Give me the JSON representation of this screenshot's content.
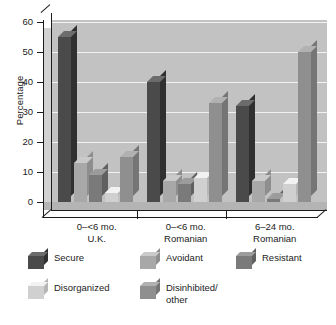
{
  "chart_data": {
    "type": "bar",
    "title": "",
    "xlabel": "",
    "ylabel": "Percentage",
    "ylim": [
      0,
      60
    ],
    "yticks": [
      0,
      10,
      20,
      30,
      40,
      50,
      60
    ],
    "grid": true,
    "legend_position": "below",
    "categories": [
      "0–<6 mo.\nU.K.",
      "0–<6 mo.\nRomanian",
      "6–24 mo.\nRomanian"
    ],
    "category_lines": [
      [
        "0–<6 mo.",
        "U.K."
      ],
      [
        "0–<6 mo.",
        "Romanian"
      ],
      [
        "6–24 mo.",
        "Romanian"
      ]
    ],
    "series": [
      {
        "name": "Secure",
        "color": "#4a4a4a",
        "values": [
          55,
          40,
          32
        ]
      },
      {
        "name": "Avoidant",
        "color": "#a8a8a8",
        "values": [
          13,
          7,
          7
        ]
      },
      {
        "name": "Resistant",
        "color": "#7a7a7a",
        "values": [
          9,
          6,
          1
        ]
      },
      {
        "name": "Disorganized",
        "color": "#d0d0d0",
        "values": [
          3,
          8,
          6
        ]
      },
      {
        "name": "Disinhibited/\nother",
        "color": "#8f8f8f",
        "values": [
          15,
          33,
          50
        ]
      }
    ]
  },
  "axis": {
    "y_title": "Percentage",
    "y_tick_labels": [
      "60",
      "50",
      "40",
      "30",
      "20",
      "10",
      "0"
    ]
  },
  "legend": {
    "entries": [
      {
        "label": "Secure"
      },
      {
        "label": "Avoidant"
      },
      {
        "label": "Resistant"
      },
      {
        "label": "Disorganized"
      },
      {
        "label": "Disinhibited/\nother"
      }
    ]
  },
  "colors": {
    "plot_background": "#c2c2c2",
    "gridline": "#f2f2f2",
    "axis": "#1c1c1c",
    "page_background": "#ffffff"
  }
}
